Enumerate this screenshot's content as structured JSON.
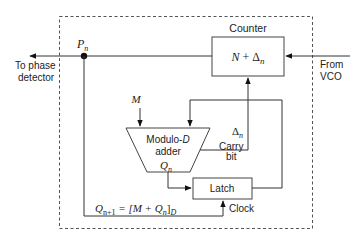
{
  "diagram": {
    "labels": {
      "counter_title": "Counter",
      "counter_content_N": "N",
      "counter_content_plus": " + ",
      "counter_content_delta": "Δ",
      "counter_content_sub": "n",
      "from_vco_line1": "From",
      "from_vco_line2": "VCO",
      "to_pd_line1": "To phase",
      "to_pd_line2": "detector",
      "pn_main": "P",
      "pn_sub": "n",
      "m_input": "M",
      "adder_line1_a": "Modulo-",
      "adder_line1_b": "D",
      "adder_line2": "adder",
      "qn_main": "Q",
      "qn_sub": "n",
      "delta_main": "Δ",
      "delta_sub": "n",
      "carry_line1": "Carry",
      "carry_line2": "bit",
      "latch": "Latch",
      "clock": "Clock",
      "eq_q": "Q",
      "eq_sub1": "n+1",
      "eq_mid": " = [M + Q",
      "eq_sub2": "n",
      "eq_close": "]",
      "eq_subD": "D"
    },
    "colors": {
      "line": "#333333",
      "box_border": "#444444",
      "dash": "#555555"
    }
  }
}
